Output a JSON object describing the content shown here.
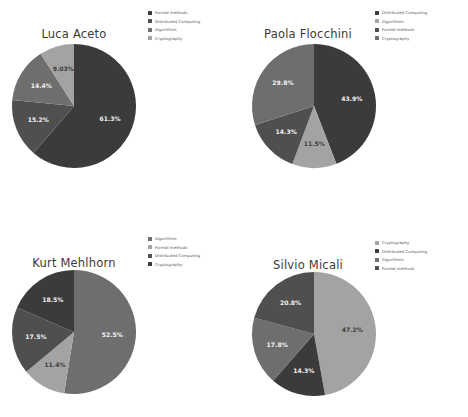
{
  "figure": {
    "kind": "pie-chart-grid",
    "rows": 2,
    "columns": 2,
    "background": "#ffffff"
  },
  "palette": {
    "slice_1": "#3b3b3b",
    "slice_2": "#4f4f4f",
    "slice_3": "#6e6e6e",
    "slice_4": "#a3a3a3",
    "label_light": "#f2f2f2",
    "label_dark": "#3d3d3d",
    "legend_text": "#555555",
    "title_text": "#3a3a3a"
  },
  "chart_data": [
    {
      "type": "pie",
      "title": "Luca Aceto",
      "legend_position": "top-right",
      "categories": [
        "Formal methods",
        "Distributed Computing",
        "Algorithms",
        "Cryptography"
      ],
      "values": [
        61.3,
        15.2,
        14.4,
        9.03
      ],
      "labels": [
        "61.3%",
        "15.2%",
        "14.4%",
        "9.03%"
      ],
      "colors": [
        "#3b3b3b",
        "#4f4f4f",
        "#6e6e6e",
        "#a3a3a3"
      ],
      "label_colors": [
        "#f2f2f2",
        "#f2f2f2",
        "#f2f2f2",
        "#3d3d3d"
      ],
      "start_angle": 0,
      "direction": "clockwise"
    },
    {
      "type": "pie",
      "title": "Paola Flocchini",
      "legend_position": "top-right",
      "categories": [
        "Distributed Computing",
        "Algorithms",
        "Formal methods",
        "Cryptography"
      ],
      "values": [
        43.9,
        11.5,
        14.3,
        29.8
      ],
      "labels": [
        "43.9%",
        "11.5%",
        "14.3%",
        "29.8%"
      ],
      "colors": [
        "#3b3b3b",
        "#a3a3a3",
        "#4f4f4f",
        "#6e6e6e"
      ],
      "label_colors": [
        "#f2f2f2",
        "#3d3d3d",
        "#f2f2f2",
        "#f2f2f2"
      ],
      "start_angle": 0,
      "direction": "clockwise"
    },
    {
      "type": "pie",
      "title": "Kurt Mehlhorn",
      "legend_position": "top-right",
      "categories": [
        "Algorithms",
        "Formal methods",
        "Distributed Computing",
        "Cryptography"
      ],
      "values": [
        52.5,
        11.4,
        17.5,
        18.5
      ],
      "labels": [
        "52.5%",
        "11.4%",
        "17.5%",
        "18.5%"
      ],
      "colors": [
        "#6e6e6e",
        "#a3a3a3",
        "#4f4f4f",
        "#3b3b3b"
      ],
      "label_colors": [
        "#f2f2f2",
        "#3d3d3d",
        "#f2f2f2",
        "#f2f2f2"
      ],
      "start_angle": 0,
      "direction": "clockwise"
    },
    {
      "type": "pie",
      "title": "Silvio Micali",
      "legend_position": "top-right",
      "categories": [
        "Cryptography",
        "Distributed Computing",
        "Algorithms",
        "Formal methods"
      ],
      "values": [
        47.2,
        14.3,
        17.8,
        20.8
      ],
      "labels": [
        "47.2%",
        "14.3%",
        "17.8%",
        "20.8%"
      ],
      "colors": [
        "#a3a3a3",
        "#3b3b3b",
        "#6e6e6e",
        "#4f4f4f"
      ],
      "label_colors": [
        "#3d3d3d",
        "#f2f2f2",
        "#f2f2f2",
        "#f2f2f2"
      ],
      "start_angle": 0,
      "direction": "clockwise"
    }
  ]
}
